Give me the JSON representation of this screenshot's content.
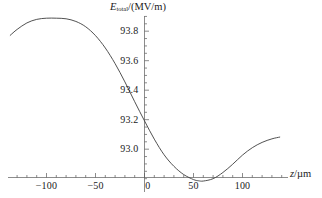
{
  "chart_data": {
    "type": "line",
    "title": "",
    "xlabel": "z/µm",
    "ylabel": "E_total/(MV/m)",
    "ylabel_parts": {
      "symbol": "E",
      "subscript": "total",
      "unit": "/(MV/m)"
    },
    "xlabel_parts": {
      "symbol": "z",
      "unit": "/µm"
    },
    "xlim": [
      -137,
      138
    ],
    "ylim": [
      92.74,
      93.93
    ],
    "grid": false,
    "legend": null,
    "x_ticks_major": [
      -100,
      -50,
      0,
      50,
      100
    ],
    "x_tick_labels": [
      "-100",
      "-50",
      "0",
      "50",
      "100"
    ],
    "x_ticks_minor_step": 10,
    "y_ticks_major": [
      93.0,
      93.2,
      93.4,
      93.6,
      93.8
    ],
    "y_tick_labels": [
      "93.0",
      "93.2",
      "93.4",
      "93.6",
      "93.8"
    ],
    "y_ticks_minor_step": 0.05,
    "axis_origin": {
      "x": 0.0,
      "y": 92.808
    },
    "series": [
      {
        "name": "E_total",
        "color": "#3d3d3d",
        "x": [
          -137,
          -130,
          -120,
          -110,
          -100,
          -90,
          -80,
          -70,
          -60,
          -50,
          -40,
          -30,
          -20,
          -10,
          0,
          10,
          20,
          30,
          40,
          50,
          55,
          60,
          70,
          80,
          90,
          100,
          110,
          120,
          130,
          138
        ],
        "y": [
          93.772,
          93.812,
          93.856,
          93.88,
          93.888,
          93.888,
          93.884,
          93.866,
          93.83,
          93.77,
          93.686,
          93.58,
          93.456,
          93.322,
          93.192,
          93.068,
          92.962,
          92.884,
          92.828,
          92.794,
          92.786,
          92.784,
          92.8,
          92.842,
          92.898,
          92.96,
          93.01,
          93.046,
          93.07,
          93.082
        ]
      }
    ],
    "annotations": {
      "maximum": {
        "x": -83,
        "y": 93.889
      },
      "minimum": {
        "x": 58,
        "y": 92.783
      }
    }
  },
  "colors": {
    "background": "#ffffff",
    "axis": "#5a5a5a",
    "curve": "#3d3d3d",
    "text": "#1a1a1a"
  }
}
